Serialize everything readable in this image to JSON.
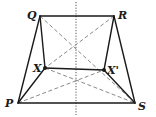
{
  "diagram": {
    "type": "geometry-figure",
    "colors": {
      "line": "#1a1a1a",
      "dashed": "#8a8a8a",
      "axis": "#555555",
      "background": "#ffffff"
    },
    "points": [
      {
        "id": "Q",
        "label": "Q",
        "x": 40,
        "y": 16,
        "lx": 27,
        "ly": 19
      },
      {
        "id": "R",
        "label": "R",
        "x": 114,
        "y": 16,
        "lx": 118,
        "ly": 19
      },
      {
        "id": "X",
        "label": "X",
        "x": 45,
        "y": 68,
        "lx": 33,
        "ly": 72
      },
      {
        "id": "Xp",
        "label": "X'",
        "x": 104,
        "y": 70,
        "lx": 107,
        "ly": 74
      },
      {
        "id": "P",
        "label": "P",
        "x": 18,
        "y": 103,
        "lx": 5,
        "ly": 107
      },
      {
        "id": "S",
        "label": "S",
        "x": 135,
        "y": 103,
        "lx": 138,
        "ly": 110
      }
    ],
    "solid_segments": [
      [
        "Q",
        "R"
      ],
      [
        "P",
        "S"
      ],
      [
        "X",
        "Xp"
      ],
      [
        "Q",
        "P"
      ],
      [
        "R",
        "S"
      ],
      [
        "Q",
        "X"
      ],
      [
        "R",
        "Xp"
      ],
      [
        "X",
        "P"
      ],
      [
        "Xp",
        "S"
      ]
    ],
    "dashed_segments": [
      [
        "Q",
        "S"
      ],
      [
        "R",
        "X"
      ],
      [
        "P",
        "Xp"
      ],
      [
        "X",
        "S"
      ]
    ],
    "axis": {
      "x": 76,
      "y1": 2,
      "y2": 115,
      "style": "dotted"
    },
    "dots": [
      "X",
      "Xp"
    ]
  }
}
